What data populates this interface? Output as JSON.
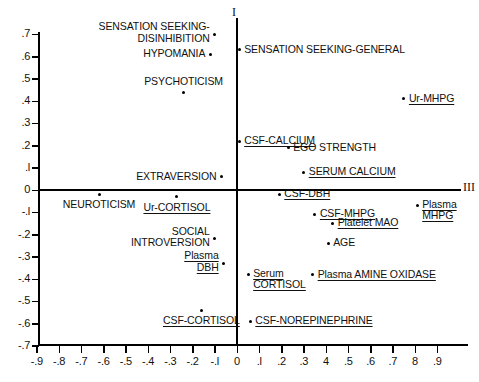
{
  "figure": {
    "axis_labels": {
      "vertical": "I",
      "horizontal": "III"
    },
    "caption": ""
  },
  "axes": {
    "x": {
      "ticks": [
        "-.9",
        "-.8",
        "-.7",
        "-.6",
        "-.5",
        "-.4",
        "-.3",
        "-.2",
        "-.l",
        "0",
        ".l",
        ".2",
        ".3",
        "4",
        ".5",
        ".6",
        ".7",
        "8",
        ".9"
      ],
      "values": [
        -0.9,
        -0.8,
        -0.7,
        -0.6,
        -0.5,
        -0.4,
        -0.3,
        -0.2,
        -0.1,
        0,
        0.1,
        0.2,
        0.3,
        0.4,
        0.5,
        0.6,
        0.7,
        0.8,
        0.9
      ],
      "min": -0.95,
      "max": 0.98
    },
    "y": {
      "ticks": [
        ".7",
        ".6",
        ".5",
        ".4",
        ".3",
        ".2",
        ".l",
        "0",
        "-.l",
        "-.2",
        "-.3",
        "-.4",
        "-.5",
        "-.6",
        "-.7"
      ],
      "values": [
        0.7,
        0.6,
        0.5,
        0.4,
        0.3,
        0.2,
        0.1,
        0,
        -0.1,
        -0.2,
        -0.3,
        -0.4,
        -0.5,
        -0.6,
        -0.7
      ],
      "min": -0.75,
      "max": 0.72
    }
  },
  "chart_data": {
    "type": "scatter",
    "title": "",
    "xlabel": "III",
    "ylabel": "I",
    "xlim": [
      -0.95,
      0.98
    ],
    "ylim": [
      -0.75,
      0.72
    ],
    "grid": false,
    "legend": null,
    "points": [
      {
        "label": "SENSATION SEEKING-\nDISINHIBITION",
        "x": -0.1,
        "y": 0.7,
        "underline": false,
        "label_pos": "left-two-line"
      },
      {
        "label": "SENSATION SEEKING-GENERAL",
        "x": 0.01,
        "y": 0.63,
        "underline": false,
        "label_pos": "right"
      },
      {
        "label": "HYPOMANIA",
        "x": -0.12,
        "y": 0.61,
        "underline": false,
        "label_pos": "left"
      },
      {
        "label": "PSYCHOTICISM",
        "x": -0.24,
        "y": 0.44,
        "underline": false,
        "label_pos": "above"
      },
      {
        "label": "Ur-MHPG",
        "x": 0.75,
        "y": 0.41,
        "underline": true,
        "label_pos": "right"
      },
      {
        "label": "CSF-CALCIUM",
        "x": 0.01,
        "y": 0.22,
        "underline": true,
        "label_pos": "right"
      },
      {
        "label": "EGO STRENGTH",
        "x": 0.23,
        "y": 0.19,
        "underline": false,
        "label_pos": "right"
      },
      {
        "label": "SERUM CALCIUM",
        "x": 0.3,
        "y": 0.08,
        "underline": true,
        "label_pos": "right"
      },
      {
        "label": "EXTRAVERSION",
        "x": -0.07,
        "y": 0.06,
        "underline": false,
        "label_pos": "left"
      },
      {
        "label": "NEUROTICISM",
        "x": -0.62,
        "y": -0.02,
        "underline": false,
        "label_pos": "below"
      },
      {
        "label": "CSF-DBH",
        "x": 0.19,
        "y": -0.02,
        "underline": true,
        "label_pos": "right"
      },
      {
        "label": "Plasma\nMHPG",
        "x": 0.81,
        "y": -0.07,
        "underline": true,
        "label_pos": "right-two-line"
      },
      {
        "label": "Ur-CORTISOL",
        "x": -0.27,
        "y": -0.03,
        "underline": true,
        "label_pos": "below"
      },
      {
        "label": "CSF-MHPG",
        "x": 0.35,
        "y": -0.11,
        "underline": true,
        "label_pos": "right"
      },
      {
        "label": "Platelet MAO",
        "x": 0.43,
        "y": -0.15,
        "underline": true,
        "label_pos": "right"
      },
      {
        "label": "SOCIAL\nINTROVERSION",
        "x": -0.1,
        "y": -0.22,
        "underline": false,
        "label_pos": "left-two-line"
      },
      {
        "label": "AGE",
        "x": 0.41,
        "y": -0.24,
        "underline": false,
        "label_pos": "right"
      },
      {
        "label": "Plasma\nDBH",
        "x": -0.06,
        "y": -0.33,
        "underline": true,
        "label_pos": "left-two-line"
      },
      {
        "label": "Serum\nCORTISOL",
        "x": 0.05,
        "y": -0.38,
        "underline": true,
        "label_pos": "right-two-line"
      },
      {
        "label": "Plasma AMINE OXIDASE",
        "x": 0.34,
        "y": -0.38,
        "underline": true,
        "label_pos": "right"
      },
      {
        "label": "CSF-CORTISOL",
        "x": -0.16,
        "y": -0.54,
        "underline": true,
        "label_pos": "below"
      },
      {
        "label": "CSF-NOREPINEPHRINE",
        "x": 0.06,
        "y": -0.59,
        "underline": true,
        "label_pos": "right"
      }
    ]
  }
}
